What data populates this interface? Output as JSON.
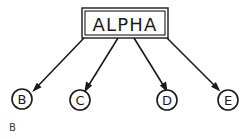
{
  "figure": {
    "type": "tree-diagram",
    "background_color": "#ffffff",
    "stroke_color": "#1a1a1a",
    "caption": "B",
    "root": {
      "label": "ALPHA",
      "shape": "rectangle",
      "box": {
        "x": 82,
        "y": 8,
        "width": 86,
        "height": 30
      }
    },
    "children": [
      {
        "label": "B",
        "shape": "circle",
        "center_x": 22,
        "center_y": 99,
        "radius": 10,
        "edge_from_x": 84,
        "edge_from_y": 38
      },
      {
        "label": "C",
        "shape": "circle",
        "center_x": 80,
        "center_y": 100,
        "radius": 10,
        "edge_from_x": 118,
        "edge_from_y": 38
      },
      {
        "label": "D",
        "shape": "circle",
        "center_x": 167,
        "center_y": 100,
        "radius": 10,
        "edge_from_x": 134,
        "edge_from_y": 38
      },
      {
        "label": "E",
        "shape": "circle",
        "center_x": 228,
        "center_y": 100,
        "radius": 10,
        "edge_from_x": 167,
        "edge_from_y": 38
      }
    ]
  }
}
